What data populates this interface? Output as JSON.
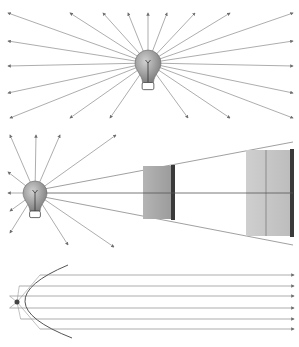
{
  "diagram": {
    "colors": {
      "ray": "#8a8a8a",
      "arrowhead": "#6e6e6e",
      "bulb_glass": "#9a9a9a",
      "bulb_highlight": "#c8c8c8",
      "plate_near": "#a8a8a8",
      "plate_far": "#c4c4c4",
      "plate_edge": "#3a3a3a",
      "reflector": "#555555",
      "focus": "#444444"
    },
    "panels": [
      {
        "id": "point-source-radiation",
        "bulb": {
          "cx": 148,
          "cy": 63,
          "r": 13
        },
        "rays": [
          [
            8,
            13
          ],
          [
            70,
            13
          ],
          [
            103,
            13
          ],
          [
            128,
            13
          ],
          [
            148,
            13
          ],
          [
            167,
            13
          ],
          [
            195,
            13
          ],
          [
            230,
            13
          ],
          [
            293,
            13
          ],
          [
            8,
            41
          ],
          [
            293,
            41
          ],
          [
            8,
            66
          ],
          [
            293,
            66
          ],
          [
            8,
            93
          ],
          [
            293,
            93
          ],
          [
            10,
            118
          ],
          [
            70,
            118
          ],
          [
            110,
            118
          ],
          [
            188,
            118
          ],
          [
            230,
            118
          ],
          [
            293,
            118
          ]
        ]
      },
      {
        "id": "inverse-square-law",
        "bulb": {
          "cx": 35,
          "cy": 193,
          "r": 12
        },
        "rays": [
          [
            10,
            135
          ],
          [
            36,
            135
          ],
          [
            60,
            135
          ],
          [
            116,
            135
          ],
          [
            8,
            172
          ],
          [
            8,
            193
          ],
          [
            10,
            211
          ],
          [
            10,
            233
          ],
          [
            68,
            245
          ],
          [
            114,
            247
          ]
        ],
        "cone": {
          "apex": [
            44,
            193
          ],
          "top_end": [
            293,
            142
          ],
          "bottom_end": [
            293,
            245
          ],
          "axis_end": [
            293,
            193
          ]
        },
        "plates": [
          {
            "x": 143,
            "y_top": 166,
            "y_bottom": 219,
            "width": 28,
            "edge_width": 4,
            "fill": "plate_near"
          },
          {
            "x": 246,
            "y_top": 150,
            "y_bottom": 236,
            "width": 44,
            "edge_width": 4,
            "fill": "plate_far",
            "divider_x": 266
          }
        ]
      },
      {
        "id": "parabolic-reflector",
        "reflector": {
          "top": [
            68,
            265
          ],
          "vertex": [
            8,
            302
          ],
          "bottom": [
            72,
            338
          ]
        },
        "focus": [
          17,
          302
        ],
        "beams_y": [
          275,
          286,
          296,
          308,
          319,
          329
        ],
        "beam_end_x": 294
      }
    ]
  }
}
